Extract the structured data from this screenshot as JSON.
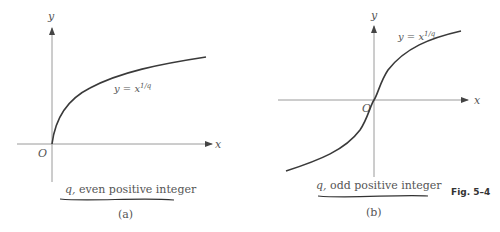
{
  "figure": {
    "label": "Fig. 5–4",
    "panels": [
      {
        "id": "a",
        "tag": "(a)",
        "curve_label": "y = x",
        "curve_exponent": "1/q",
        "axis_x": "x",
        "axis_y": "y",
        "origin": "O",
        "caption_var": "q,",
        "caption_text": "even positive integer"
      },
      {
        "id": "b",
        "tag": "(b)",
        "curve_label": "y = x",
        "curve_exponent": "1/q",
        "axis_x": "x",
        "axis_y": "y",
        "origin": "O",
        "caption_var": "q,",
        "caption_text": "odd positive integer"
      }
    ]
  },
  "colors": {
    "axis": "#9a9a9a",
    "curve": "#3a3a3a",
    "text": "#555555"
  }
}
